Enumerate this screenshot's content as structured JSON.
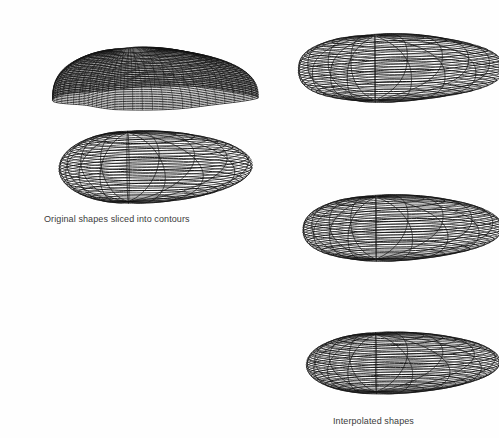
{
  "figure": {
    "background_color": "#ffffff",
    "ink_color": "#111111",
    "caption_color": "#3b3b3b",
    "captions": {
      "original": "Original shapes sliced into contours",
      "interpolated": "Interpolated shapes"
    },
    "columns": [
      {
        "name": "original-column",
        "caption_key": "original",
        "shapes": [
          {
            "id": "original-car-sliced",
            "label": "car-shape-sliced-contours",
            "kind": "stacked-contour-slices",
            "x": 18,
            "y": 8,
            "w": 215,
            "h": 105
          },
          {
            "id": "original-blob-sliced",
            "label": "blob-shape-sliced-contours",
            "kind": "wireframe-mesh",
            "x": 10,
            "y": 118,
            "w": 230,
            "h": 92
          }
        ]
      },
      {
        "name": "interpolated-column",
        "caption_key": "interpolated",
        "shapes": [
          {
            "id": "interp-stage-1",
            "label": "interpolated-shape-car-like",
            "kind": "wireframe-mesh",
            "x": 258,
            "y": 10,
            "w": 232,
            "h": 112,
            "blend": 0.15
          },
          {
            "id": "interp-stage-2",
            "label": "interpolated-shape-middle",
            "kind": "wireframe-mesh",
            "x": 262,
            "y": 172,
            "w": 224,
            "h": 110,
            "blend": 0.5
          },
          {
            "id": "interp-stage-3",
            "label": "interpolated-shape-blob-like",
            "kind": "wireframe-mesh",
            "x": 262,
            "y": 312,
            "w": 224,
            "h": 100,
            "blend": 0.88
          }
        ]
      }
    ],
    "shape_count": 5,
    "contour_slice_count": 26,
    "mesh_longitude_lines": 17,
    "mesh_latitude_lines": 24
  }
}
